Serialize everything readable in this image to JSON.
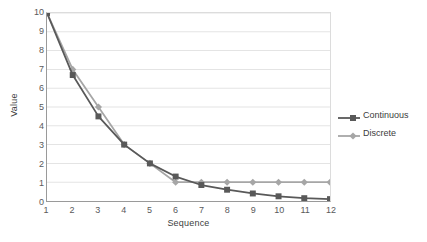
{
  "chart_data": {
    "type": "line",
    "title": "",
    "xlabel": "Sequence",
    "ylabel": "Value",
    "x": [
      1,
      2,
      3,
      4,
      5,
      6,
      7,
      8,
      9,
      10,
      11,
      12
    ],
    "categories": [
      "1",
      "2",
      "3",
      "4",
      "5",
      "6",
      "7",
      "8",
      "9",
      "10",
      "11",
      "12"
    ],
    "xlim": [
      1,
      12
    ],
    "ylim": [
      0,
      10
    ],
    "y_ticks": [
      0,
      1,
      2,
      3,
      4,
      5,
      6,
      7,
      8,
      9,
      10
    ],
    "y_tick_labels": [
      "0",
      "1",
      "2",
      "3",
      "4",
      "5",
      "6",
      "7",
      "8",
      "9",
      "10"
    ],
    "grid": "horizontal",
    "legend_position": "right",
    "series": [
      {
        "name": "Continuous",
        "color": "#595959",
        "marker": "square",
        "values": [
          10,
          6.7,
          4.5,
          3.0,
          2.0,
          1.3,
          0.85,
          0.6,
          0.4,
          0.25,
          0.15,
          0.1
        ]
      },
      {
        "name": "Discrete",
        "color": "#a6a6a6",
        "marker": "diamond",
        "values": [
          10,
          7.0,
          5.0,
          3.0,
          2.0,
          1.0,
          1.0,
          1.0,
          1.0,
          1.0,
          1.0,
          1.0
        ]
      }
    ]
  },
  "legend": {
    "items": [
      {
        "label": "Continuous"
      },
      {
        "label": "Discrete"
      }
    ]
  },
  "axes": {
    "x_title": "Sequence",
    "y_title": "Value"
  },
  "colors": {
    "continuous": "#595959",
    "discrete": "#a6a6a6",
    "gridline": "#e4e4e4",
    "axis": "#9a9a9a",
    "text": "#59595b",
    "background": "#ffffff"
  }
}
